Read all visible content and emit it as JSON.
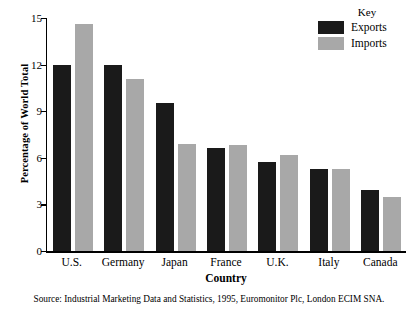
{
  "chart_data": {
    "type": "bar",
    "title": "",
    "xlabel": "Country",
    "ylabel": "Percentage of World Total",
    "categories": [
      "U.S.",
      "Germany",
      "Japan",
      "France",
      "U.K.",
      "Italy",
      "Canada"
    ],
    "series": [
      {
        "name": "Exports",
        "color": "#1a1a1a",
        "values": [
          12.0,
          12.0,
          9.5,
          6.6,
          5.7,
          5.3,
          3.9
        ]
      },
      {
        "name": "Imports",
        "color": "#a8a8a8",
        "values": [
          14.6,
          11.1,
          6.9,
          6.8,
          6.2,
          5.3,
          3.5
        ]
      }
    ],
    "ylim": [
      0,
      15
    ],
    "yticks": [
      0,
      3,
      6,
      9,
      12,
      15
    ],
    "ytick_labels": [
      "0",
      "3",
      "6",
      "9",
      "12",
      "15"
    ],
    "grid": false,
    "legend": {
      "title": "Key",
      "position": "top-right"
    }
  },
  "legend": {
    "title": "Key",
    "entries": [
      {
        "label": "Exports",
        "color": "#1a1a1a"
      },
      {
        "label": "Imports",
        "color": "#a8a8a8"
      }
    ]
  },
  "axes": {
    "y_title": "Percentage of World Total",
    "x_title": "Country"
  },
  "source": "Source: Industrial Marketing Data and Statistics, 1995, Euromonitor Plc, London ECIM SNA."
}
